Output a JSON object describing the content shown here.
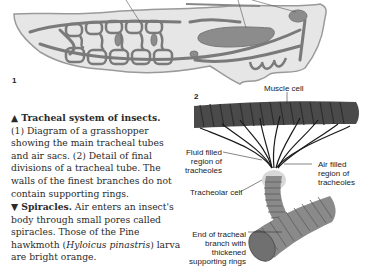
{
  "figure1": {
    "number": "1",
    "subject": "grasshopper tracheal system diagram",
    "colors": {
      "body_fill": "#e6e6e6",
      "body_outline": "#9a9a9a",
      "trachea": "#7a7a7a",
      "air_sac": "#8c8c8c"
    }
  },
  "figure2": {
    "number": "2",
    "labels": {
      "muscle_cell": "Muscle cell",
      "fluid_filled": [
        "Fluid filled",
        "region of",
        "tracheoles"
      ],
      "air_filled": [
        "Air filled",
        "region of",
        "tracheoles"
      ],
      "tracheolar_cell": "Tracheolar cell",
      "end_of_branch": [
        "End of tracheal",
        "branch with",
        "thickened",
        "supporting rings"
      ]
    },
    "colors": {
      "muscle": "#4a4a4a",
      "tube": "#8a8a8a",
      "tracheole": "#1a1a1a"
    }
  },
  "caption1": {
    "marker": "▲",
    "title": "Tracheal system of insects.",
    "body": [
      {
        "text": "(1) Diagram of a grasshopper"
      },
      {
        "text": "showing the main tracheal tubes"
      },
      {
        "text": "and air sacs. (2) Detail of final"
      },
      {
        "text": "divisions of a tracheal tube. The"
      },
      {
        "text": "walls of the finest branches do not"
      },
      {
        "text": "contain supporting rings."
      }
    ]
  },
  "caption2": {
    "marker": "▼",
    "title": "Spiracles.",
    "lead": " Air enters an insect's",
    "lines": [
      "body through small pores called",
      "spiracles. Those of the Pine",
      "hawkmoth ("
    ],
    "species": "Hyloicus pinastris",
    "after_species": ") larva",
    "last": "are bright orange."
  }
}
